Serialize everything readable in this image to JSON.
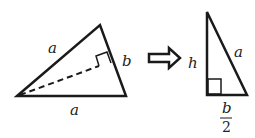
{
  "diagram": {
    "left_triangle": {
      "label_left_side": "a",
      "label_right_side": "b",
      "label_bottom_side": "a",
      "has_dashed_altitude": true,
      "has_right_angle_marker": true
    },
    "arrow": "implies-arrow",
    "right_triangle": {
      "label_height": "h",
      "label_hypotenuse": "a",
      "label_base_numerator": "b",
      "label_base_denominator": "2",
      "has_right_angle_marker": true
    },
    "colors": {
      "stroke": "#1a1a1a",
      "background": "#ffffff"
    }
  }
}
